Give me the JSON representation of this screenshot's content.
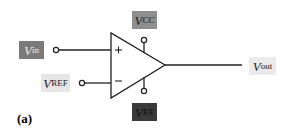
{
  "diagram": {
    "type": "op-amp comparator schematic",
    "caption": "(a)",
    "labels": {
      "vin": {
        "main": "V",
        "sub": "in",
        "bg": "#7a7a7a",
        "fg": "#f0f0f0"
      },
      "vref": {
        "main": "V",
        "sub": "REF",
        "bg": "#e6e6e6",
        "fg": "#222222"
      },
      "vcc": {
        "main": "V",
        "sub": "CC",
        "bg": "#8e8e8e",
        "fg": "#1a1a1a"
      },
      "vee": {
        "main": "V",
        "sub": "EE",
        "bg": "#3a3a3a",
        "fg": "#111111"
      },
      "vout": {
        "main": "V",
        "sub": "out",
        "bg": "#ebebeb",
        "fg": "#222222"
      }
    },
    "symbols": {
      "noninverting": "+",
      "inverting": "−"
    }
  }
}
